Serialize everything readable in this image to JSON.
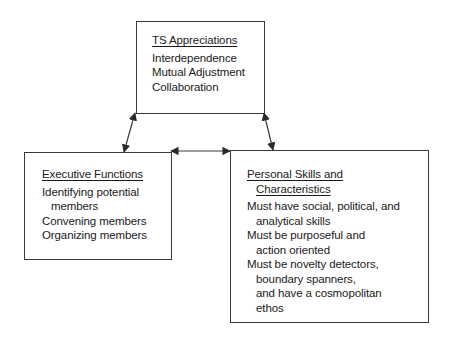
{
  "diagram": {
    "boxes": {
      "ts_appreciations": {
        "title": "TS Appreciations",
        "items": [
          "Interdependence",
          "Mutual Adjustment",
          "Collaboration"
        ]
      },
      "executive_functions": {
        "title": "Executive Functions",
        "items": [
          {
            "line1": "Identifying potential",
            "line2": "members"
          },
          {
            "line1": "Convening members"
          },
          {
            "line1": "Organizing members"
          }
        ]
      },
      "personal_skills": {
        "title_line1": "Personal Skills and",
        "title_line2": "Characteristics",
        "items": [
          {
            "line1": "Must have social, political, and",
            "line2": "analytical skills"
          },
          {
            "line1": "Must be purposeful and",
            "line2": "action oriented"
          },
          {
            "line1": "Must be novelty detectors,",
            "line2": "boundary spanners,",
            "line3": "and have a cosmopolitan",
            "line4": "ethos"
          }
        ]
      }
    },
    "connections": [
      {
        "from": "TS Appreciations",
        "to": "Executive Functions",
        "type": "bidirectional"
      },
      {
        "from": "TS Appreciations",
        "to": "Personal Skills and Characteristics",
        "type": "bidirectional"
      },
      {
        "from": "Executive Functions",
        "to": "Personal Skills and Characteristics",
        "type": "bidirectional"
      }
    ],
    "colors": {
      "line": "#3a3a3a",
      "text": "#1a1a1a",
      "background": "#ffffff"
    }
  }
}
